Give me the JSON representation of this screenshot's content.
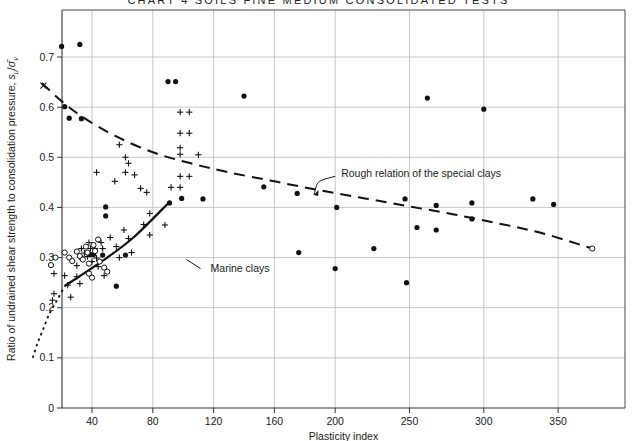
{
  "figure": {
    "cut_header_text": "CHART 4 SOILS FINE  MEDIUM CONSOLIDATED TESTS",
    "plot_area": {
      "left": 62,
      "right": 625,
      "top": 10,
      "bottom": 408
    }
  },
  "chart_data": {
    "type": "scatter",
    "title": "",
    "xlabel": "Plasticity index",
    "ylabel": "Ratio of undrained shear strength to consolidation pressure, sᵤ/σ̄ᵥ",
    "ylabel_parts": {
      "prefix": "Ratio of undrained shear strength to consolidation pressure, ",
      "sym_num": "s",
      "sym_num_sub": "u",
      "slash": "/",
      "sym_den": "σ̄",
      "sym_den_sub": "v"
    },
    "xlim": [
      0,
      378
    ],
    "ylim": [
      0,
      0.75
    ],
    "grid": true,
    "x_ticks": [
      40,
      80,
      120,
      160,
      200,
      250,
      300,
      350
    ],
    "x_tick_labels": [
      "40",
      "80",
      "120",
      "160",
      "200",
      "250",
      "300",
      "350"
    ],
    "y_ticks": [
      0,
      0.1,
      0.2,
      0.3,
      0.4,
      0.5,
      0.6,
      0.7
    ],
    "y_tick_labels": [
      "0",
      "0.1",
      "0.2",
      "0.3",
      "0.4",
      "0.5",
      "0.6",
      "0.7"
    ],
    "legend_position": "none",
    "annotations": [
      {
        "id": "marine-clays",
        "text": "Marine clays",
        "x": 78,
        "y": 0.285,
        "tx": 118,
        "ty": 0.278
      },
      {
        "id": "rough-relation",
        "text": "Rough relation of the special clays",
        "x": 186,
        "y": 0.425,
        "tx": 204,
        "ty": 0.468
      }
    ],
    "series": [
      {
        "name": "filled-circles",
        "marker": "filled-circle",
        "points": [
          [
            20,
            0.721
          ],
          [
            32,
            0.725
          ],
          [
            90,
            0.651
          ],
          [
            95,
            0.651
          ],
          [
            140,
            0.622
          ],
          [
            262,
            0.618
          ],
          [
            300,
            0.596
          ],
          [
            22,
            0.601
          ],
          [
            25,
            0.578
          ],
          [
            33,
            0.577
          ],
          [
            49,
            0.383
          ],
          [
            49,
            0.401
          ],
          [
            91,
            0.409
          ],
          [
            99,
            0.418
          ],
          [
            113,
            0.417
          ],
          [
            153,
            0.441
          ],
          [
            175,
            0.428
          ],
          [
            201,
            0.4
          ],
          [
            247,
            0.417
          ],
          [
            268,
            0.404
          ],
          [
            292,
            0.409
          ],
          [
            333,
            0.417
          ],
          [
            347,
            0.406
          ],
          [
            255,
            0.36
          ],
          [
            268,
            0.355
          ],
          [
            292,
            0.377
          ],
          [
            176,
            0.31
          ],
          [
            200,
            0.278
          ],
          [
            226,
            0.318
          ],
          [
            248,
            0.25
          ],
          [
            41,
            0.306
          ],
          [
            47,
            0.305
          ],
          [
            62,
            0.305
          ],
          [
            56,
            0.243
          ],
          [
            39,
            0.306
          ],
          [
            33,
            0.299
          ]
        ]
      },
      {
        "name": "plus-markers",
        "marker": "plus",
        "points": [
          [
            15,
            0.268
          ],
          [
            15,
            0.228
          ],
          [
            14,
            0.215
          ],
          [
            22,
            0.264
          ],
          [
            24,
            0.245
          ],
          [
            26,
            0.221
          ],
          [
            30,
            0.284
          ],
          [
            30,
            0.262
          ],
          [
            32,
            0.248
          ],
          [
            33,
            0.318
          ],
          [
            35,
            0.309
          ],
          [
            37,
            0.302
          ],
          [
            38,
            0.33
          ],
          [
            39,
            0.318
          ],
          [
            40,
            0.292
          ],
          [
            42,
            0.318
          ],
          [
            43,
            0.299
          ],
          [
            44,
            0.282
          ],
          [
            46,
            0.33
          ],
          [
            47,
            0.318
          ],
          [
            48,
            0.264
          ],
          [
            52,
            0.34
          ],
          [
            56,
            0.322
          ],
          [
            58,
            0.3
          ],
          [
            61,
            0.355
          ],
          [
            64,
            0.338
          ],
          [
            66,
            0.31
          ],
          [
            74,
            0.366
          ],
          [
            78,
            0.345
          ],
          [
            43,
            0.47
          ],
          [
            55,
            0.452
          ],
          [
            58,
            0.525
          ],
          [
            62,
            0.5
          ],
          [
            64,
            0.488
          ],
          [
            62,
            0.47
          ],
          [
            68,
            0.465
          ],
          [
            72,
            0.438
          ],
          [
            76,
            0.43
          ],
          [
            78,
            0.388
          ],
          [
            88,
            0.365
          ],
          [
            98,
            0.59
          ],
          [
            104,
            0.59
          ],
          [
            98,
            0.548
          ],
          [
            104,
            0.548
          ],
          [
            98,
            0.519
          ],
          [
            98,
            0.506
          ],
          [
            110,
            0.505
          ],
          [
            98,
            0.462
          ],
          [
            104,
            0.462
          ],
          [
            92,
            0.44
          ],
          [
            98,
            0.44
          ]
        ]
      },
      {
        "name": "open-circles",
        "marker": "open-circle",
        "points": [
          [
            13,
            0.285
          ],
          [
            16,
            0.3
          ],
          [
            22,
            0.31
          ],
          [
            25,
            0.3
          ],
          [
            27,
            0.293
          ],
          [
            30,
            0.312
          ],
          [
            32,
            0.303
          ],
          [
            34,
            0.296
          ],
          [
            36,
            0.322
          ],
          [
            37,
            0.31
          ],
          [
            38,
            0.288
          ],
          [
            41,
            0.325
          ],
          [
            42,
            0.313
          ],
          [
            44,
            0.336
          ],
          [
            45,
            0.292
          ],
          [
            48,
            0.28
          ],
          [
            50,
            0.272
          ],
          [
            38,
            0.268
          ],
          [
            40,
            0.26
          ]
        ]
      },
      {
        "name": "x-marker",
        "marker": "x",
        "points": [
          [
            8,
            0.643
          ]
        ]
      },
      {
        "name": "curve-endpoint",
        "marker": "open-circle",
        "points": [
          [
            373,
            0.318
          ]
        ]
      }
    ],
    "curves": [
      {
        "name": "rough-relation-dashed",
        "style": "dashed",
        "points": [
          [
            7,
            0.648
          ],
          [
            20,
            0.612
          ],
          [
            35,
            0.578
          ],
          [
            55,
            0.543
          ],
          [
            80,
            0.51
          ],
          [
            105,
            0.488
          ],
          [
            130,
            0.47
          ],
          [
            160,
            0.452
          ],
          [
            190,
            0.434
          ],
          [
            220,
            0.418
          ],
          [
            250,
            0.402
          ],
          [
            280,
            0.386
          ],
          [
            310,
            0.368
          ],
          [
            340,
            0.348
          ],
          [
            373,
            0.318
          ]
        ]
      },
      {
        "name": "marine-clays-solid",
        "style": "solid",
        "points": [
          [
            22,
            0.243
          ],
          [
            50,
            0.3
          ],
          [
            68,
            0.342
          ],
          [
            90,
            0.408
          ]
        ]
      },
      {
        "name": "marine-clays-dotted-extension",
        "style": "dotted",
        "points": [
          [
            1,
            0.1
          ],
          [
            4,
            0.128
          ],
          [
            8,
            0.158
          ],
          [
            12,
            0.188
          ],
          [
            17,
            0.215
          ],
          [
            22,
            0.243
          ]
        ]
      }
    ]
  }
}
